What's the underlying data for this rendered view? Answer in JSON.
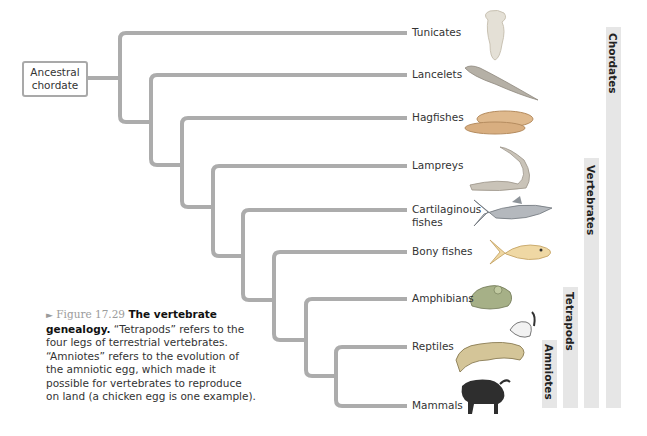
{
  "diagram": {
    "type": "cladogram",
    "root_label_line1": "Ancestral",
    "root_label_line2": "chordate",
    "branch_color": "#acacac",
    "leaves": [
      {
        "label": "Tunicates",
        "y": 33,
        "icon": "tunicate-icon"
      },
      {
        "label": "Lancelets",
        "y": 75,
        "icon": "lancelet-icon"
      },
      {
        "label": "Hagfishes",
        "y": 118,
        "icon": "hagfish-icon"
      },
      {
        "label": "Lampreys",
        "y": 166,
        "icon": "lamprey-icon"
      },
      {
        "label_line1": "Cartilaginous",
        "label_line2": "fishes",
        "y": 210,
        "icon": "shark-icon"
      },
      {
        "label": "Bony fishes",
        "y": 252,
        "icon": "bony-fish-icon"
      },
      {
        "label": "Amphibians",
        "y": 299,
        "icon": "frog-icon"
      },
      {
        "label": "Reptiles",
        "y": 347,
        "icon": "lizard-bird-icon"
      },
      {
        "label": "Mammals",
        "y": 406,
        "icon": "wildebeest-icon"
      }
    ],
    "groups": [
      {
        "label": "Chordates",
        "from": "Tunicates",
        "to": "Mammals"
      },
      {
        "label": "Vertebrates",
        "from": "Hagfishes",
        "to": "Mammals"
      },
      {
        "label": "Tetrapods",
        "from": "Amphibians",
        "to": "Mammals"
      },
      {
        "label": "Amniotes",
        "from": "Reptiles",
        "to": "Mammals"
      }
    ]
  },
  "caption": {
    "arrow": "►",
    "figure_number": "Figure 17.29",
    "title": "The vertebrate genealogy.",
    "body": " “Tetrapods” refers to the four legs of terrestrial vertebrates. “Amniotes” refers to the evolution of the amniotic egg, which made it possible for vertebrates to reproduce on land (a chicken egg is one example)."
  }
}
